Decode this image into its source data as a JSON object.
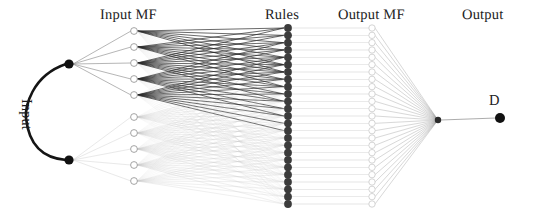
{
  "diagram": {
    "background_color": "#ffffff",
    "width": 545,
    "height": 219,
    "labels": {
      "input_mf": "Input MF",
      "rules": "Rules",
      "output_mf": "Output MF",
      "output": "Output",
      "input_brace": "Input",
      "output_node": "D"
    },
    "colors": {
      "input_node": "#111111",
      "input_mf_node_stroke": "#9a9a9a",
      "input_mf_node_fill": "#ffffff",
      "rule_node": "#3c3c3c",
      "output_mf_node_stroke": "#cfcfcf",
      "output_mf_node_fill": "#ffffff",
      "aggregate_node": "#2b2b2b",
      "output_node": "#111111",
      "edge_dark": "#2a2a2a",
      "edge_mid": "#8d8d8d",
      "edge_light": "#c8c8c8",
      "brace": "#151515"
    },
    "layers": [
      {
        "name": "input",
        "x": 69,
        "node_count": 2,
        "node_radius": 4.6,
        "nodes_y": [
          64,
          160
        ]
      },
      {
        "name": "input-mf",
        "x": 134,
        "node_count": 10,
        "node_radius": 3.4,
        "nodes_y": [
          31,
          47,
          63,
          79,
          95,
          117,
          133,
          149,
          165,
          181
        ]
      },
      {
        "name": "rules",
        "x": 288,
        "node_count": 25,
        "node_radius": 3.9,
        "y_start": 28,
        "y_end": 204
      },
      {
        "name": "output-mf",
        "x": 372,
        "node_count": 25,
        "node_radius": 3.2,
        "y_start": 28,
        "y_end": 204
      },
      {
        "name": "aggregate",
        "x": 438,
        "node_count": 1,
        "node_radius": 3.2,
        "nodes_y": [
          120
        ]
      },
      {
        "name": "output",
        "x": 500,
        "node_count": 1,
        "node_radius": 5.0,
        "nodes_y": [
          118
        ]
      }
    ],
    "brace": {
      "top_y": 64,
      "bottom_y": 160,
      "tip_x": 66,
      "bulge_x": 25
    }
  }
}
